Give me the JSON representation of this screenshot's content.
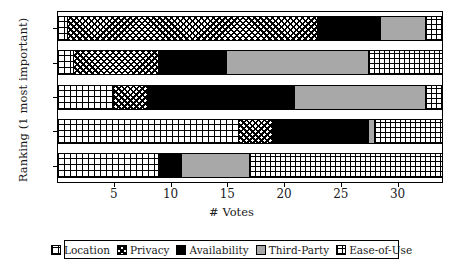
{
  "chart_data": {
    "type": "bar",
    "orientation": "horizontal",
    "stacked": true,
    "title": "",
    "xlabel": "# Votes",
    "ylabel": "Ranking (1 most important)",
    "categories": [
      "1",
      "2",
      "3",
      "4",
      "5"
    ],
    "xlim": [
      0,
      34
    ],
    "xticks": [
      5,
      10,
      15,
      20,
      25,
      30
    ],
    "xticklabels": [
      "5",
      "10",
      "15",
      "20",
      "25",
      "30"
    ],
    "grid": false,
    "legend_position": "bottom",
    "series": [
      {
        "name": "Location",
        "color": "#ffffff",
        "pattern": "grid",
        "values": [
          1,
          1.5,
          5,
          16,
          9
        ]
      },
      {
        "name": "Privacy",
        "color": "#ffffff",
        "pattern": "checkerboard",
        "values": [
          22,
          7.5,
          3,
          3,
          0
        ]
      },
      {
        "name": "Availability",
        "color": "#000000",
        "pattern": "solid",
        "values": [
          5.5,
          6,
          13,
          8.5,
          2
        ]
      },
      {
        "name": "Third-Party",
        "color": "#a8a8a8",
        "pattern": "solid-gray",
        "values": [
          4,
          12.5,
          11.5,
          0.5,
          6
        ]
      },
      {
        "name": "Ease-of-Use",
        "color": "#ffffff",
        "pattern": "fine-grid",
        "values": [
          1.5,
          6.5,
          1.5,
          6,
          17
        ]
      }
    ],
    "row_totals": [
      34,
      34,
      34,
      34,
      34
    ]
  },
  "axis": {
    "y_title": "Ranking (1 most important)",
    "x_title": "# Votes",
    "y_tick_labels": [
      "1",
      "2",
      "3",
      "4",
      "5"
    ],
    "x_tick_labels": [
      "5",
      "10",
      "15",
      "20",
      "25",
      "30"
    ]
  },
  "legend": {
    "items": [
      {
        "label": "Location"
      },
      {
        "label": "Privacy"
      },
      {
        "label": "Availability"
      },
      {
        "label": "Third-Party"
      },
      {
        "label": "Ease-of-Use"
      }
    ]
  }
}
